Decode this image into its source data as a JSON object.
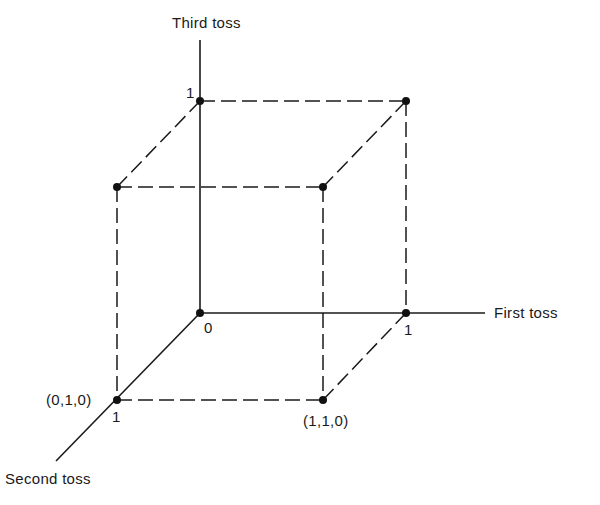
{
  "diagram": {
    "type": "3d-cube-sample-space",
    "axes": {
      "third": {
        "label": "Third toss",
        "tick": "1"
      },
      "first": {
        "label": "First toss",
        "tick": "1"
      },
      "second": {
        "label": "Second toss",
        "tick": "1"
      }
    },
    "origin_label": "0",
    "vertex_labels": {
      "v010": "(0,1,0)",
      "v110": "(1,1,0)"
    },
    "vertices": [
      {
        "id": "000",
        "x": 200,
        "y": 313
      },
      {
        "id": "001",
        "x": 200,
        "y": 101
      },
      {
        "id": "100",
        "x": 406,
        "y": 313
      },
      {
        "id": "101",
        "x": 406,
        "y": 101
      },
      {
        "id": "010",
        "x": 117,
        "y": 400
      },
      {
        "id": "011",
        "x": 117,
        "y": 187
      },
      {
        "id": "110",
        "x": 323,
        "y": 400
      },
      {
        "id": "111",
        "x": 323,
        "y": 187
      }
    ],
    "colors": {
      "ink": "#1a1a1a",
      "background": "#ffffff"
    }
  }
}
